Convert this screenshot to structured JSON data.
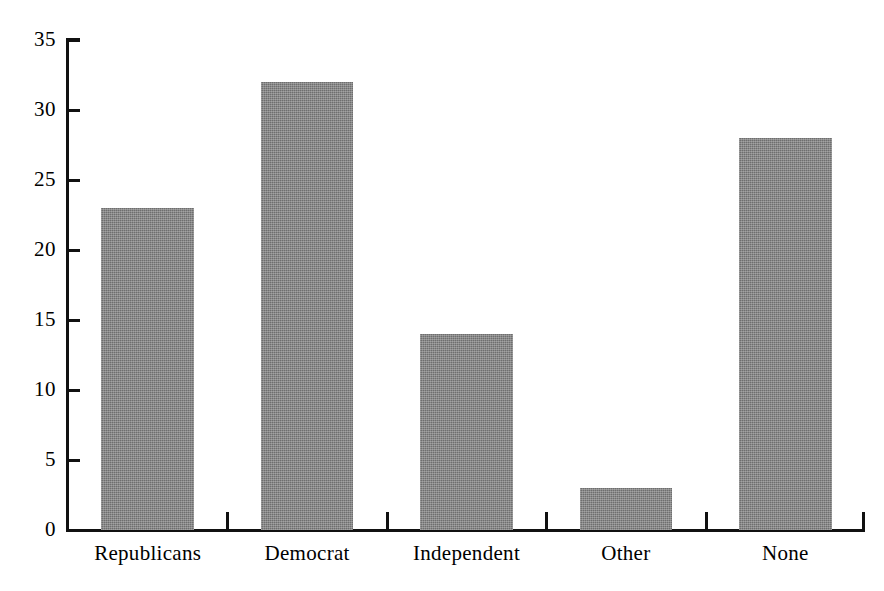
{
  "chart_data": {
    "type": "bar",
    "title": "",
    "subtitle": "",
    "xlabel": "",
    "ylabel": "",
    "categories": [
      "Republicans",
      "Democrat",
      "Independent",
      "Other",
      "None"
    ],
    "values": [
      23,
      32,
      14,
      3,
      28
    ],
    "ylim": [
      0,
      35
    ],
    "y_ticks": [
      0,
      5,
      10,
      15,
      20,
      25,
      30,
      35
    ],
    "y_tick_labels": [
      "0",
      "5",
      "10",
      "15",
      "20",
      "25",
      "30",
      "35"
    ],
    "grid": false,
    "legend": null,
    "legend_position": "none",
    "annotations": [],
    "bar_color": "#6e6e6e",
    "axis_color": "#111111",
    "background_color": "#ffffff"
  }
}
